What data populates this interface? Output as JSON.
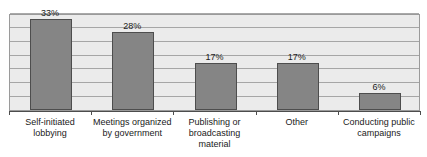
{
  "chart_data": {
    "type": "bar",
    "title": "",
    "subtitle": "",
    "xlabel": "",
    "ylabel": "",
    "ylim": [
      0,
      35
    ],
    "grid": true,
    "gridlines": [
      0,
      5,
      10,
      15,
      20,
      25,
      30,
      35
    ],
    "legend": null,
    "legend_position": "none",
    "value_suffix": "%",
    "categories": [
      "Self-initiated lobbying",
      "Meetings organized by government",
      "Publishing or broadcasting material",
      "Other",
      "Conducting public campaigns"
    ],
    "category_lines": [
      [
        "Self-initiated",
        "lobbying"
      ],
      [
        "Meetings organized",
        "by government"
      ],
      [
        "Publishing or",
        "broadcasting",
        "material"
      ],
      [
        "Other"
      ],
      [
        "Conducting public",
        "campaigns"
      ]
    ],
    "values": [
      33,
      28,
      17,
      17,
      6
    ],
    "value_labels": [
      "33%",
      "28%",
      "17%",
      "17%",
      "6%"
    ],
    "colors": {
      "bar_fill": "#858585",
      "bar_border": "#4d4d4d",
      "plot_background": "#ebebeb",
      "gridline": "#9a9a9a",
      "axis": "#4d4d4d",
      "page_background": "#ffffff",
      "text": "#1a1a1a"
    }
  }
}
